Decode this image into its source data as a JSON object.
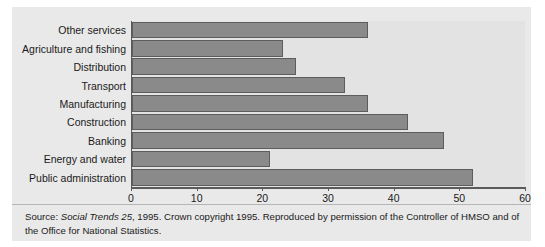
{
  "chart_data": {
    "type": "bar",
    "orientation": "horizontal",
    "title": "",
    "xlabel": "",
    "ylabel": "",
    "xlim": [
      0,
      60
    ],
    "xticks": [
      0,
      10,
      20,
      30,
      40,
      50,
      60
    ],
    "xtick_labels": [
      "0",
      "10",
      "20",
      "30",
      "40",
      "50",
      "60"
    ],
    "grid": false,
    "legend": null,
    "bar_color": "#8a8a8a",
    "bar_edge_color": "#5d5d5d",
    "plot_background": "#e3e3e3",
    "panel_background": "#e9e9e9",
    "categories": [
      "Other services",
      "Agriculture and fishing",
      "Distribution",
      "Transport",
      "Manufacturing",
      "Construction",
      "Banking",
      "Energy and water",
      "Public administration"
    ],
    "values": [
      36,
      23,
      25,
      32.5,
      36,
      42,
      47.5,
      21,
      52
    ]
  },
  "note": {
    "source_prefix": "Source: ",
    "source_italic": "Social Trends 25",
    "source_rest": ", 1995. Crown copyright 1995. Reproduced by permission of the Controller of HMSO and of the Office for National Statistics."
  }
}
